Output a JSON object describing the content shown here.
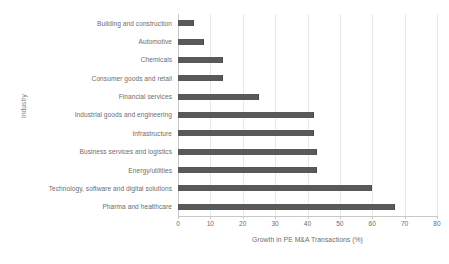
{
  "chart_data": {
    "type": "bar",
    "orientation": "horizontal",
    "title": "",
    "xlabel": "Growth in PE M&A Transactions (%)",
    "ylabel": "Industry",
    "xlim": [
      0,
      80
    ],
    "xticks": [
      0,
      10,
      20,
      30,
      40,
      50,
      60,
      70,
      80
    ],
    "xtick_labels": [
      "0",
      "10",
      "20",
      "30",
      "40",
      "50",
      "60",
      "70",
      "80"
    ],
    "grid": true,
    "grid_axis": "x",
    "legend": false,
    "bar_color": "#595959",
    "grid_color": "#e8e8e8",
    "axis_color": "#c8c8c8",
    "text_color": "#6d6d6d",
    "background": "#ffffff",
    "categories": [
      "Building and construction",
      "Automotive",
      "Chemicals",
      "Consumer goods and retail",
      "Financial services",
      "Industrial goods and engineering",
      "Infrastructure",
      "Business services and logistics",
      "Energy/utilities",
      "Technology, software and digital solutions",
      "Pharma and healthcare"
    ],
    "values": [
      5,
      8,
      14,
      14,
      25,
      42,
      42,
      43,
      43,
      60,
      67
    ]
  }
}
